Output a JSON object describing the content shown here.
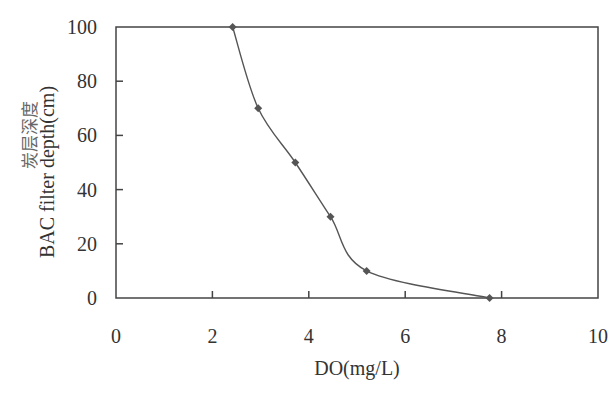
{
  "chart_data": {
    "type": "line",
    "title": "",
    "xlabel": "DO(mg/L)",
    "ylabel": "BAC filter depth(cm)",
    "ylabel_secondary": "炭层深度",
    "xlim": [
      0,
      10
    ],
    "ylim": [
      0,
      100
    ],
    "x_ticks": [
      "0",
      "2",
      "4",
      "6",
      "8",
      "10"
    ],
    "y_ticks": [
      "0",
      "20",
      "40",
      "60",
      "80",
      "100"
    ],
    "grid": false,
    "legend": null,
    "series": [
      {
        "name": "DO",
        "marker": "diamond",
        "smooth": true,
        "color": "#555555",
        "x": [
          2.42,
          2.95,
          3.72,
          4.45,
          5.2,
          7.75
        ],
        "y": [
          100,
          70,
          50,
          30,
          10,
          0
        ]
      }
    ]
  }
}
